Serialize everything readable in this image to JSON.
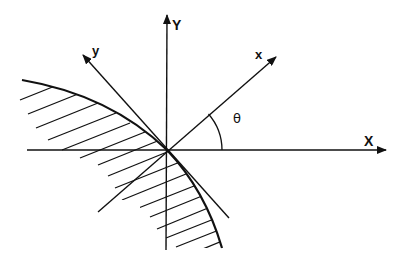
{
  "figure": {
    "type": "coordinate-rotation-diagram",
    "colors": {
      "line": "#111111",
      "background": "#ffffff"
    }
  },
  "labels": {
    "X_axis": "X",
    "Y_axis": "Y",
    "x_axis": "x",
    "y_axis": "y",
    "angle": "θ"
  }
}
